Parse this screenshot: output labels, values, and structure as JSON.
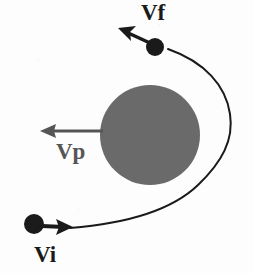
{
  "figure": {
    "background_color": "#fdfdfd",
    "width": 253,
    "height": 273
  },
  "colors": {
    "planet_gray": "#6a6a6a",
    "trajectory_black": "#1a1a1a",
    "spacecraft_black": "#1a1a1a",
    "planet_arrow_gray": "#555555",
    "label_black": "#1a1a1a"
  },
  "planet": {
    "name": "planet",
    "shape": "circle",
    "center_x": 150,
    "center_y": 135,
    "radius": 50,
    "fill": "#6a6a6a"
  },
  "trajectory": {
    "name": "hyperbolic-flyby-path",
    "stroke": "#1a1a1a",
    "stroke_width": 2,
    "path": "M 70 228 C 120 224 170 212 198 185 C 222 162 234 140 230 114 C 226 86 205 62 168 49"
  },
  "vectors": [
    {
      "id": "vi",
      "label": "Vi",
      "meaning": "initial velocity of spacecraft",
      "color": "#1a1a1a",
      "direction": "right",
      "tail_x": 44,
      "tail_y": 225,
      "head_x": 72,
      "head_y": 226,
      "label_x": 34,
      "label_y": 243
    },
    {
      "id": "vp",
      "label": "Vp",
      "meaning": "velocity of planet",
      "color": "#555555",
      "direction": "left",
      "tail_x": 103,
      "tail_y": 131,
      "head_x": 41,
      "head_y": 131,
      "label_x": 56,
      "label_y": 140
    },
    {
      "id": "vf",
      "label": "Vf",
      "meaning": "final velocity of spacecraft",
      "color": "#1a1a1a",
      "direction": "up-left",
      "tail_x": 149,
      "tail_y": 43,
      "head_x": 119,
      "head_y": 29,
      "label_x": 141,
      "label_y": 1
    }
  ],
  "spacecraft": [
    {
      "id": "spacecraft-initial",
      "state": "incoming",
      "center_x": 34,
      "center_y": 224,
      "radius": 10,
      "fill": "#1a1a1a"
    },
    {
      "id": "spacecraft-final",
      "state": "outgoing",
      "center_x": 155,
      "center_y": 47,
      "radius": 9,
      "fill": "#1a1a1a"
    }
  ]
}
